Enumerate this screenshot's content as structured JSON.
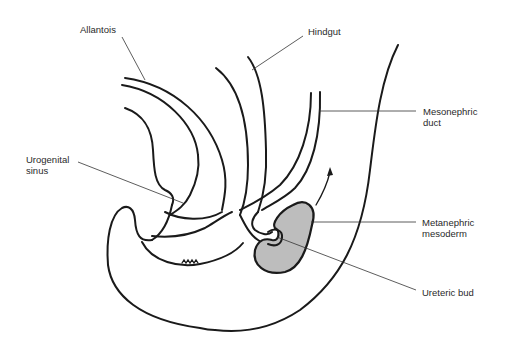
{
  "diagram": {
    "colors": {
      "line": "#1a1a1a",
      "leader": "#333333",
      "metanephric_fill": "#bdbdbd",
      "background": "#ffffff"
    },
    "labels": {
      "allantois": "Allantois",
      "hindgut": "Hindgut",
      "mesonephric_duct": "Mesonephric\nduct",
      "urogenital_sinus": "Urogenital\nsinus",
      "metanephric_mesoderm": "Metanephric\nmesoderm",
      "ureteric_bud": "Ureteric bud"
    }
  }
}
